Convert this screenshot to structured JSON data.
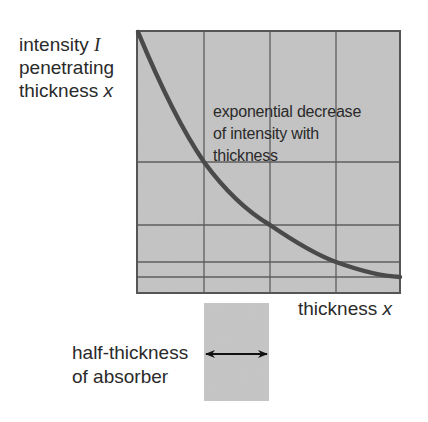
{
  "diagram": {
    "title": "Exponential decrease of intensity with thickness",
    "y_axis_label": {
      "line1": "intensity",
      "line1_symbol": "I",
      "line2": "penetrating",
      "line3": "thickness",
      "line3_symbol": "x"
    },
    "x_axis_label": {
      "text": "thickness",
      "symbol": "x"
    },
    "curve_annotation": {
      "line1": "exponential decrease",
      "line2": "of intensity with",
      "line3": "thickness"
    },
    "half_thickness": {
      "line1": "half-thickness",
      "line2": "of absorber",
      "arrow": "double-headed-arrow"
    },
    "colors": {
      "plot_fill": "#c4c4c4",
      "grid_line": "#5a5a5a",
      "frame": "#555555",
      "curve": "#4a4a4a",
      "text": "#2a2a2a",
      "background": "#ffffff"
    },
    "grid": {
      "vertical_lines_x": [
        137,
        204,
        270,
        336,
        400
      ],
      "horizontal_lines_y": [
        31,
        162,
        225,
        262,
        277,
        293
      ]
    },
    "curve_points": [
      {
        "x": 0,
        "relative_intensity": 1.0
      },
      {
        "x": 1,
        "relative_intensity": 0.5
      },
      {
        "x": 2,
        "relative_intensity": 0.25
      },
      {
        "x": 3,
        "relative_intensity": 0.125
      },
      {
        "x": 4,
        "relative_intensity": 0.0625
      }
    ]
  }
}
